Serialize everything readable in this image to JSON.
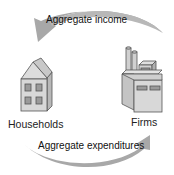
{
  "diagram": {
    "type": "circular-flow",
    "nodes": [
      {
        "id": "households",
        "label": "Households",
        "icon": "house-icon"
      },
      {
        "id": "firms",
        "label": "Firms",
        "icon": "factory-icon"
      }
    ],
    "flows": [
      {
        "id": "aggregate-income",
        "label": "Aggregate income",
        "from": "firms",
        "to": "households",
        "position": "top"
      },
      {
        "id": "aggregate-expenditures",
        "label": "Aggregate expenditures",
        "from": "households",
        "to": "firms",
        "position": "bottom"
      }
    ],
    "colors": {
      "arrow": "#a8a8a8",
      "building_fill": "#d0d0d0",
      "building_stroke": "#555555",
      "text": "#222222"
    }
  }
}
